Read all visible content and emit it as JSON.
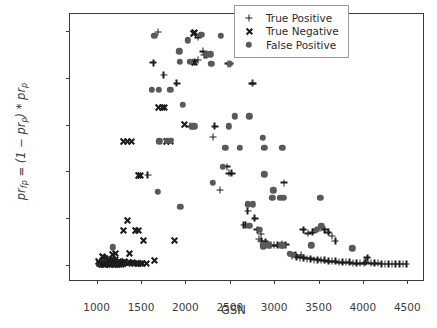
{
  "chart_data": {
    "type": "scatter",
    "title": "",
    "xlabel": "GSN",
    "ylabel": "pr_fp = (1 - pr_p) * pr_p",
    "xlim": [
      700,
      4700
    ],
    "ylim": [
      -0.018,
      0.268
    ],
    "xticks": [
      1000,
      1500,
      2000,
      2500,
      3000,
      3500,
      4000,
      4500
    ],
    "yticks": [
      0.0,
      0.05,
      0.1,
      0.15,
      0.2,
      0.25
    ],
    "xticklabels": [
      "1000",
      "1500",
      "2000",
      "2500",
      "3000",
      "3500",
      "4000",
      "4500"
    ],
    "yticklabels": [
      "0.00",
      "0.05",
      "0.10",
      "0.15",
      "0.20",
      "0.25"
    ],
    "grid": false,
    "legend_position": "upper right",
    "colors": {
      "true_positive": "#1c1c1c",
      "true_negative": "#1c1c1c",
      "false_positive": "#595959",
      "axis": "#3b3b3b",
      "background": "#ffffff"
    },
    "series": [
      {
        "name": "True Positive",
        "marker": "plus",
        "points": [
          [
            1690,
            0.249
          ],
          [
            1900,
            0.194
          ],
          [
            1755,
            0.203
          ],
          [
            1640,
            0.216
          ],
          [
            2140,
            0.243
          ],
          [
            2200,
            0.228
          ],
          [
            2215,
            0.224
          ],
          [
            2240,
            0.224
          ],
          [
            2105,
            0.217
          ],
          [
            2480,
            0.215
          ],
          [
            2500,
            0.215
          ],
          [
            2750,
            0.194
          ],
          [
            2760,
            0.194
          ],
          [
            2330,
            0.148
          ],
          [
            2050,
            0.148
          ],
          [
            2310,
            0.137
          ],
          [
            2470,
            0.105
          ],
          [
            2490,
            0.098
          ],
          [
            2520,
            0.098
          ],
          [
            2390,
            0.08
          ],
          [
            1575,
            0.096
          ],
          [
            2700,
            0.058
          ],
          [
            2780,
            0.05
          ],
          [
            2655,
            0.043
          ],
          [
            2680,
            0.043
          ],
          [
            2810,
            0.038
          ],
          [
            2850,
            0.033
          ],
          [
            3110,
            0.088
          ],
          [
            2830,
            0.028
          ],
          [
            2855,
            0.026
          ],
          [
            2900,
            0.025
          ],
          [
            2930,
            0.022
          ],
          [
            2960,
            0.021
          ],
          [
            3000,
            0.021
          ],
          [
            3040,
            0.021
          ],
          [
            3090,
            0.023
          ],
          [
            3130,
            0.022
          ],
          [
            3330,
            0.038
          ],
          [
            3380,
            0.034
          ],
          [
            3430,
            0.035
          ],
          [
            3470,
            0.038
          ],
          [
            3530,
            0.04
          ],
          [
            3570,
            0.038
          ],
          [
            3610,
            0.035
          ],
          [
            3650,
            0.031
          ],
          [
            3690,
            0.026
          ],
          [
            3200,
            0.01
          ],
          [
            3250,
            0.009
          ],
          [
            3290,
            0.008
          ],
          [
            3330,
            0.008
          ],
          [
            3370,
            0.007
          ],
          [
            3410,
            0.007
          ],
          [
            3450,
            0.006
          ],
          [
            3490,
            0.006
          ],
          [
            3530,
            0.005
          ],
          [
            3570,
            0.005
          ],
          [
            3610,
            0.004
          ],
          [
            3650,
            0.004
          ],
          [
            3690,
            0.004
          ],
          [
            3730,
            0.003
          ],
          [
            3770,
            0.003
          ],
          [
            3810,
            0.003
          ],
          [
            3850,
            0.003
          ],
          [
            3890,
            0.002
          ],
          [
            3930,
            0.002
          ],
          [
            3970,
            0.002
          ],
          [
            4010,
            0.002
          ],
          [
            4050,
            0.008
          ],
          [
            4090,
            0.002
          ],
          [
            4130,
            0.002
          ],
          [
            4170,
            0.002
          ],
          [
            4210,
            0.001
          ],
          [
            4250,
            0.001
          ],
          [
            4290,
            0.001
          ],
          [
            4330,
            0.001
          ],
          [
            4370,
            0.001
          ],
          [
            4410,
            0.001
          ],
          [
            4450,
            0.001
          ],
          [
            4490,
            0.001
          ],
          [
            4030,
            0.003
          ],
          [
            3300,
            0.011
          ],
          [
            3240,
            0.011
          ],
          [
            2140,
            0.219
          ]
        ]
      },
      {
        "name": "True Negative",
        "marker": "cross",
        "points": [
          [
            2105,
            0.249
          ],
          [
            2085,
            0.248
          ],
          [
            2100,
            0.217
          ],
          [
            1990,
            0.151
          ],
          [
            1700,
            0.169
          ],
          [
            1735,
            0.169
          ],
          [
            1765,
            0.169
          ],
          [
            1300,
            0.133
          ],
          [
            1345,
            0.133
          ],
          [
            1390,
            0.133
          ],
          [
            1790,
            0.133
          ],
          [
            1825,
            0.133
          ],
          [
            1470,
            0.096
          ],
          [
            1490,
            0.096
          ],
          [
            1350,
            0.048
          ],
          [
            1300,
            0.037
          ],
          [
            1440,
            0.037
          ],
          [
            1470,
            0.037
          ],
          [
            1530,
            0.027
          ],
          [
            1880,
            0.027
          ],
          [
            1370,
            0.013
          ],
          [
            1060,
            0.01
          ],
          [
            1080,
            0.009
          ],
          [
            1100,
            0.008
          ],
          [
            1130,
            0.007
          ],
          [
            1160,
            0.006
          ],
          [
            1190,
            0.005
          ],
          [
            1215,
            0.007
          ],
          [
            1240,
            0.004
          ],
          [
            1270,
            0.003
          ],
          [
            1290,
            0.003
          ],
          [
            1310,
            0.004
          ],
          [
            1340,
            0.002
          ],
          [
            1370,
            0.003
          ],
          [
            1400,
            0.003
          ],
          [
            1430,
            0.002
          ],
          [
            1460,
            0.002
          ],
          [
            1490,
            0.002
          ],
          [
            1520,
            0.002
          ],
          [
            1560,
            0.002
          ],
          [
            1650,
            0.005
          ],
          [
            1030,
            0.002
          ],
          [
            1050,
            0.001
          ],
          [
            1070,
            0.001
          ],
          [
            1090,
            0.001
          ],
          [
            1110,
            0.002
          ],
          [
            1140,
            0.001
          ],
          [
            1170,
            0.001
          ],
          [
            1200,
            0.001
          ],
          [
            1230,
            0.001
          ],
          [
            1255,
            0.001
          ],
          [
            1280,
            0.001
          ],
          [
            1180,
            0.012
          ],
          [
            1215,
            0.013
          ],
          [
            1015,
            0.004
          ]
        ]
      },
      {
        "name": "False Positive",
        "marker": "circle",
        "points": [
          [
            1650,
            0.245
          ],
          [
            2030,
            0.24
          ],
          [
            2180,
            0.246
          ],
          [
            2400,
            0.245
          ],
          [
            2600,
            0.245
          ],
          [
            1930,
            0.228
          ],
          [
            2240,
            0.225
          ],
          [
            2280,
            0.225
          ],
          [
            2290,
            0.215
          ],
          [
            2500,
            0.215
          ],
          [
            2780,
            0.225
          ],
          [
            1940,
            0.217
          ],
          [
            2050,
            0.217
          ],
          [
            1620,
            0.187
          ],
          [
            1700,
            0.187
          ],
          [
            1830,
            0.187
          ],
          [
            1970,
            0.171
          ],
          [
            2080,
            0.148
          ],
          [
            2100,
            0.148
          ],
          [
            2560,
            0.159
          ],
          [
            2720,
            0.159
          ],
          [
            2490,
            0.148
          ],
          [
            2870,
            0.136
          ],
          [
            2450,
            0.125
          ],
          [
            2610,
            0.125
          ],
          [
            2890,
            0.125
          ],
          [
            3090,
            0.125
          ],
          [
            1790,
            0.133
          ],
          [
            1830,
            0.133
          ],
          [
            2420,
            0.105
          ],
          [
            2890,
            0.097
          ],
          [
            2310,
            0.088
          ],
          [
            2990,
            0.08
          ],
          [
            2980,
            0.072
          ],
          [
            3070,
            0.072
          ],
          [
            3110,
            0.072
          ],
          [
            3520,
            0.072
          ],
          [
            1690,
            0.078
          ],
          [
            1945,
            0.062
          ],
          [
            2700,
            0.065
          ],
          [
            2760,
            0.065
          ],
          [
            3480,
            0.038
          ],
          [
            3530,
            0.042
          ],
          [
            3420,
            0.021
          ],
          [
            3100,
            0.021
          ],
          [
            3080,
            0.021
          ],
          [
            3180,
            0.012
          ],
          [
            3210,
            0.011
          ],
          [
            2880,
            0.022
          ],
          [
            2940,
            0.021
          ],
          [
            3880,
            0.018
          ],
          [
            1180,
            0.019
          ],
          [
            1705,
            0.132
          ],
          [
            2840,
            0.038
          ],
          [
            2880,
            0.02
          ],
          [
            2720,
            0.042
          ]
        ]
      }
    ]
  },
  "legend": {
    "entries": [
      {
        "label": "True Positive",
        "marker": "plus"
      },
      {
        "label": "True Negative",
        "marker": "cross"
      },
      {
        "label": "False Positive",
        "marker": "circle"
      }
    ]
  },
  "axis_label_parts": {
    "y_prefix": "pr",
    "y_sub1": "fp",
    "y_mid": " = (1 − pr",
    "y_sub2": "p",
    "y_mid2": ") * pr",
    "y_sub3": "p",
    "x_label": "GSN"
  }
}
